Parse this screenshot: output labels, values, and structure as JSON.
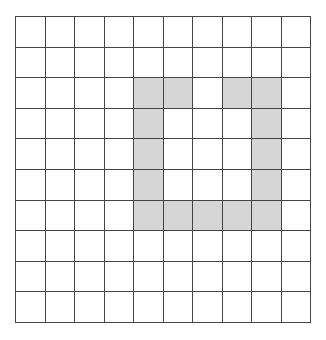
{
  "grid": {
    "rows": 10,
    "cols": 10,
    "fill_color": "#d6d6d6",
    "empty_color": "#ffffff",
    "line_color": "#444444",
    "filled_cells": [
      [
        2,
        4
      ],
      [
        2,
        5
      ],
      [
        2,
        7
      ],
      [
        2,
        8
      ],
      [
        3,
        4
      ],
      [
        3,
        8
      ],
      [
        4,
        4
      ],
      [
        4,
        8
      ],
      [
        5,
        4
      ],
      [
        5,
        8
      ],
      [
        6,
        4
      ],
      [
        6,
        5
      ],
      [
        6,
        6
      ],
      [
        6,
        7
      ],
      [
        6,
        8
      ]
    ]
  }
}
